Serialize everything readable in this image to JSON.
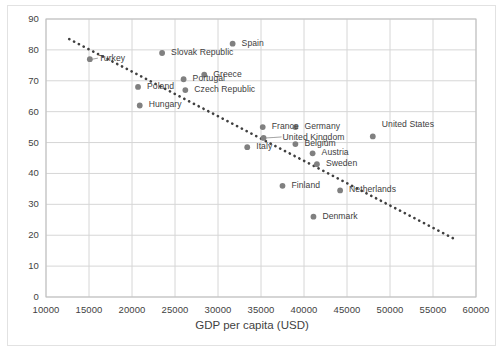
{
  "chart_data": {
    "type": "scatter",
    "title": "",
    "xlabel": "GDP per capita (USD)",
    "ylabel": "",
    "xlim": [
      10000,
      60000
    ],
    "ylim": [
      0,
      90
    ],
    "xticks": [
      "10000",
      "15000",
      "20000",
      "25000",
      "30000",
      "35000",
      "40000",
      "45000",
      "50000",
      "55000",
      "60000"
    ],
    "yticks": [
      "0",
      "10",
      "20",
      "30",
      "40",
      "50",
      "60",
      "70",
      "80",
      "90"
    ],
    "grid": true,
    "legend": "none",
    "marker_color": "#808080",
    "trendline": {
      "style": "dotted",
      "color": "#404040",
      "x_start": 12700,
      "y_start": 83.5,
      "x_end": 57700,
      "y_end": 18.5
    },
    "points": [
      {
        "label": "Turkey",
        "x": 15100,
        "y": 77.0,
        "label_dx": 9,
        "label_dy": -4,
        "leader": true
      },
      {
        "label": "Poland",
        "x": 20700,
        "y": 68.0,
        "label_dx": 9,
        "label_dy": -4,
        "leader": false
      },
      {
        "label": "Hungary",
        "x": 20900,
        "y": 62.0,
        "label_dx": 9,
        "label_dy": -4,
        "leader": false
      },
      {
        "label": "Slovak Republic",
        "x": 23500,
        "y": 79.0,
        "label_dx": 9,
        "label_dy": -4,
        "leader": false
      },
      {
        "label": "Portugal",
        "x": 26000,
        "y": 70.5,
        "label_dx": 9,
        "label_dy": -4,
        "leader": false
      },
      {
        "label": "Czech Republic",
        "x": 26200,
        "y": 67.0,
        "label_dx": 9,
        "label_dy": -4,
        "leader": false
      },
      {
        "label": "Greece",
        "x": 28400,
        "y": 72.0,
        "label_dx": 9,
        "label_dy": -4,
        "leader": false
      },
      {
        "label": "Spain",
        "x": 31700,
        "y": 82.0,
        "label_dx": 9,
        "label_dy": -4,
        "leader": false
      },
      {
        "label": "Italy",
        "x": 33400,
        "y": 48.5,
        "label_dx": 9,
        "label_dy": -4,
        "leader": false
      },
      {
        "label": "France",
        "x": 35200,
        "y": 55.0,
        "label_dx": 9,
        "label_dy": -4,
        "leader": false
      },
      {
        "label": "United Kingdom",
        "x": 35300,
        "y": 51.5,
        "label_dx": 19,
        "label_dy": -4,
        "leader": true
      },
      {
        "label": "Germany",
        "x": 39000,
        "y": 55.0,
        "label_dx": 9,
        "label_dy": -4,
        "leader": false
      },
      {
        "label": "Belgium",
        "x": 39000,
        "y": 49.5,
        "label_dx": 9,
        "label_dy": -4,
        "leader": false
      },
      {
        "label": "Finland",
        "x": 37500,
        "y": 36.0,
        "label_dx": 9,
        "label_dy": -4,
        "leader": false
      },
      {
        "label": "Austria",
        "x": 41000,
        "y": 46.5,
        "label_dx": 9,
        "label_dy": -4,
        "leader": false
      },
      {
        "label": "Sweden",
        "x": 41500,
        "y": 43.0,
        "label_dx": 9,
        "label_dy": -4,
        "leader": false
      },
      {
        "label": "Denmark",
        "x": 41100,
        "y": 26.0,
        "label_dx": 9,
        "label_dy": -4,
        "leader": false
      },
      {
        "label": "Netherlands",
        "x": 44200,
        "y": 34.5,
        "label_dx": 9,
        "label_dy": -4,
        "leader": false
      },
      {
        "label": "United States",
        "x": 48000,
        "y": 52.0,
        "label_dx": 9,
        "label_dy": -15,
        "leader": false
      }
    ]
  }
}
